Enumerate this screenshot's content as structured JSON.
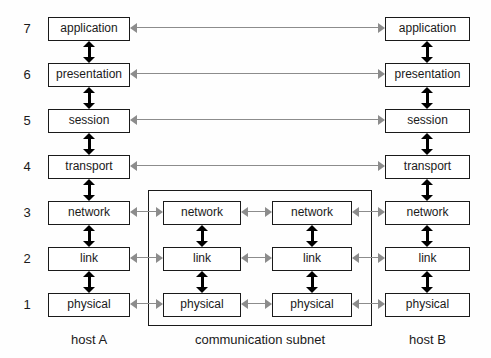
{
  "diagram": {
    "colors": {
      "box_border": "#1a1a1a",
      "box_fill": "#ffffff",
      "vertical_arrow": "#000000",
      "peer_arrow": "#8c8c8c",
      "background": "#fefefe",
      "text": "#1a1a1a"
    }
  },
  "layer_numbers": [
    {
      "label": "7",
      "top": 17
    },
    {
      "label": "6",
      "top": 63
    },
    {
      "label": "5",
      "top": 109
    },
    {
      "label": "4",
      "top": 155
    },
    {
      "label": "3",
      "top": 201
    },
    {
      "label": "2",
      "top": 247
    },
    {
      "label": "1",
      "top": 293
    }
  ],
  "columns": [
    {
      "name": "host-a",
      "caption": "host A",
      "left": 48,
      "width": 82
    },
    {
      "name": "subnet-left",
      "caption": "",
      "left": 163,
      "width": 78
    },
    {
      "name": "subnet-right",
      "caption": "",
      "left": 272,
      "width": 80
    },
    {
      "name": "host-b",
      "caption": "host B",
      "left": 385,
      "width": 85
    }
  ],
  "captions": [
    {
      "name": "caption-host-a",
      "text": "host A",
      "left": 48,
      "width": 82,
      "top": 332
    },
    {
      "name": "caption-subnet",
      "text": "communication subnet",
      "left": 148,
      "width": 224,
      "top": 332
    },
    {
      "name": "caption-host-b",
      "text": "host B",
      "left": 385,
      "width": 85,
      "top": 332
    }
  ],
  "subnet_box": {
    "left": 148,
    "top": 190,
    "width": 224,
    "height": 136
  },
  "boxes": [
    {
      "name": "host-a-application",
      "text": "application",
      "left": 48,
      "top": 17,
      "width": 82
    },
    {
      "name": "host-a-presentation",
      "text": "presentation",
      "left": 48,
      "top": 63,
      "width": 82
    },
    {
      "name": "host-a-session",
      "text": "session",
      "left": 48,
      "top": 109,
      "width": 82
    },
    {
      "name": "host-a-transport",
      "text": "transport",
      "left": 48,
      "top": 155,
      "width": 82
    },
    {
      "name": "host-a-network",
      "text": "network",
      "left": 48,
      "top": 201,
      "width": 82
    },
    {
      "name": "host-a-link",
      "text": "link",
      "left": 48,
      "top": 247,
      "width": 82
    },
    {
      "name": "host-a-physical",
      "text": "physical",
      "left": 48,
      "top": 293,
      "width": 82
    },
    {
      "name": "subnet-left-network",
      "text": "network",
      "left": 163,
      "top": 201,
      "width": 78
    },
    {
      "name": "subnet-left-link",
      "text": "link",
      "left": 163,
      "top": 247,
      "width": 78
    },
    {
      "name": "subnet-left-physical",
      "text": "physical",
      "left": 163,
      "top": 293,
      "width": 78
    },
    {
      "name": "subnet-right-network",
      "text": "network",
      "left": 272,
      "top": 201,
      "width": 80
    },
    {
      "name": "subnet-right-link",
      "text": "link",
      "left": 272,
      "top": 247,
      "width": 80
    },
    {
      "name": "subnet-right-physical",
      "text": "physical",
      "left": 272,
      "top": 293,
      "width": 80
    },
    {
      "name": "host-b-application",
      "text": "application",
      "left": 385,
      "top": 17,
      "width": 85
    },
    {
      "name": "host-b-presentation",
      "text": "presentation",
      "left": 385,
      "top": 63,
      "width": 85
    },
    {
      "name": "host-b-session",
      "text": "session",
      "left": 385,
      "top": 109,
      "width": 85
    },
    {
      "name": "host-b-transport",
      "text": "transport",
      "left": 385,
      "top": 155,
      "width": 85
    },
    {
      "name": "host-b-network",
      "text": "network",
      "left": 385,
      "top": 201,
      "width": 85
    },
    {
      "name": "host-b-link",
      "text": "link",
      "left": 385,
      "top": 247,
      "width": 85
    },
    {
      "name": "host-b-physical",
      "text": "physical",
      "left": 385,
      "top": 293,
      "width": 85
    }
  ],
  "vertical_arrows": [
    {
      "name": "host-a-arrow-7-6",
      "left": 83,
      "top": 41,
      "height": 22
    },
    {
      "name": "host-a-arrow-6-5",
      "left": 83,
      "top": 87,
      "height": 22
    },
    {
      "name": "host-a-arrow-5-4",
      "left": 83,
      "top": 133,
      "height": 22
    },
    {
      "name": "host-a-arrow-4-3",
      "left": 83,
      "top": 179,
      "height": 22
    },
    {
      "name": "host-a-arrow-3-2",
      "left": 83,
      "top": 225,
      "height": 22
    },
    {
      "name": "host-a-arrow-2-1",
      "left": 83,
      "top": 271,
      "height": 22
    },
    {
      "name": "subnet-left-arrow-3-2",
      "left": 196,
      "top": 225,
      "height": 22
    },
    {
      "name": "subnet-left-arrow-2-1",
      "left": 196,
      "top": 271,
      "height": 22
    },
    {
      "name": "subnet-right-arrow-3-2",
      "left": 306,
      "top": 225,
      "height": 22
    },
    {
      "name": "subnet-right-arrow-2-1",
      "left": 306,
      "top": 271,
      "height": 22
    },
    {
      "name": "host-b-arrow-7-6",
      "left": 421,
      "top": 41,
      "height": 22
    },
    {
      "name": "host-b-arrow-6-5",
      "left": 421,
      "top": 87,
      "height": 22
    },
    {
      "name": "host-b-arrow-5-4",
      "left": 421,
      "top": 133,
      "height": 22
    },
    {
      "name": "host-b-arrow-4-3",
      "left": 421,
      "top": 179,
      "height": 22
    },
    {
      "name": "host-b-arrow-3-2",
      "left": 421,
      "top": 225,
      "height": 22
    },
    {
      "name": "host-b-arrow-2-1",
      "left": 421,
      "top": 271,
      "height": 22
    }
  ],
  "peer_arrows": [
    {
      "name": "peer-link-application",
      "left": 130,
      "top": 23,
      "width": 255
    },
    {
      "name": "peer-link-presentation",
      "left": 130,
      "top": 69,
      "width": 255
    },
    {
      "name": "peer-link-session",
      "left": 130,
      "top": 115,
      "width": 255
    },
    {
      "name": "peer-link-transport",
      "left": 130,
      "top": 161,
      "width": 255
    },
    {
      "name": "peer-link-network-a-subnet",
      "left": 130,
      "top": 207,
      "width": 33
    },
    {
      "name": "peer-link-network-subnet",
      "left": 241,
      "top": 207,
      "width": 31
    },
    {
      "name": "peer-link-network-subnet-b",
      "left": 352,
      "top": 207,
      "width": 33
    },
    {
      "name": "peer-link-link-a-subnet",
      "left": 130,
      "top": 253,
      "width": 33
    },
    {
      "name": "peer-link-link-subnet",
      "left": 241,
      "top": 253,
      "width": 31
    },
    {
      "name": "peer-link-link-subnet-b",
      "left": 352,
      "top": 253,
      "width": 33
    },
    {
      "name": "peer-link-physical-a-subnet",
      "left": 130,
      "top": 299,
      "width": 33
    },
    {
      "name": "peer-link-physical-subnet",
      "left": 241,
      "top": 299,
      "width": 31
    },
    {
      "name": "peer-link-physical-subnet-b",
      "left": 352,
      "top": 299,
      "width": 33
    }
  ]
}
